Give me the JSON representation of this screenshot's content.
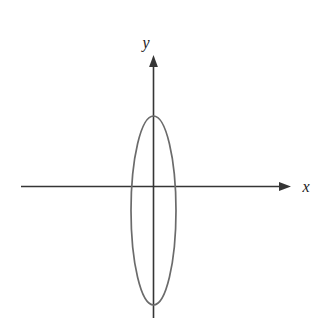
{
  "figure": {
    "background_color": "#ffffff",
    "width": 323,
    "height": 326,
    "axis_color": "#353535",
    "curve_color": "#6b6b6b",
    "label_color": "#1a1a1a",
    "x_axis_label": "x",
    "y_axis_label": "y"
  },
  "chart_data": {
    "type": "line",
    "title": "",
    "subtitle": "",
    "xlabel": "x",
    "ylabel": "y",
    "grid": false,
    "legend": false,
    "legend_position": "none",
    "axes": {
      "x_axis": {
        "label": "x",
        "orientation": "horizontal",
        "arrow": "right",
        "tick_labels": [],
        "pixel_y": 186,
        "pixel_x_start": 21,
        "pixel_x_end": 291
      },
      "y_axis": {
        "label": "y",
        "orientation": "vertical",
        "arrow": "up",
        "tick_labels": [],
        "pixel_x": 153,
        "pixel_y_start": 55,
        "pixel_y_end": 318
      },
      "origin_pixel": [
        153,
        186
      ],
      "xlim": [
        -132,
        138
      ],
      "ylim": [
        -132,
        131
      ]
    },
    "series": [
      {
        "name": "ellipse",
        "type": "closed-curve",
        "shape": "ellipse",
        "center_pixel": [
          153.5,
          210.5
        ],
        "semi_axis_x_pixels": 22.5,
        "semi_axis_y_pixels": 94.5,
        "orientation": "vertical-major",
        "stroke": "#6b6b6b",
        "fill": "none",
        "description": "tall narrow vertical ellipse centred slightly below the x-axis"
      }
    ],
    "annotations": []
  }
}
